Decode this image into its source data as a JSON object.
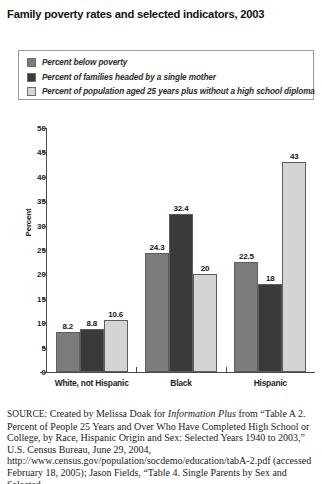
{
  "title": "Family poverty rates and selected indicators, 2003",
  "legend": {
    "items": [
      {
        "label": "Percent below poverty",
        "color": "#7c7c7c",
        "swatch_name": "legend-swatch-below-poverty"
      },
      {
        "label": "Percent of families headed by a single mother",
        "color": "#3a3a3a",
        "swatch_name": "legend-swatch-single-mother"
      },
      {
        "label": "Percent of population aged 25 years plus without a high school diploma",
        "color": "#d4d4d4",
        "swatch_name": "legend-swatch-no-diploma"
      }
    ]
  },
  "axes": {
    "ylabel": "Percent",
    "yticks": [
      "0",
      "5",
      "10",
      "15",
      "20",
      "25",
      "30",
      "35",
      "40",
      "45",
      "50"
    ]
  },
  "source": {
    "prefix": "SOURCE:",
    "line1_a": " Created by Melissa Doak for ",
    "line1_italic": "Information Plus",
    "line1_b": " from “Table A 2. Percent of People 25 Years and Over Who Have Completed High School or College, by Race, Hispanic Origin and Sex: Selected Years 1940 to 2003,” U.S. Census Bureau, June 29, 2004, http://www.census.gov/population/socdemo/education/tabA-2.pdf (accessed February 18, 2005); Jason Fields, “Table 4. Single Parents by Sex and Selected"
  },
  "chart_data": {
    "type": "bar",
    "title": "Family poverty rates and selected indicators, 2003",
    "xlabel": "",
    "ylabel": "Percent",
    "ylim": [
      0,
      50
    ],
    "ytick_step": 5,
    "grid": false,
    "legend_position": "top",
    "categories": [
      "White, not Hispanic",
      "Black",
      "Hispanic"
    ],
    "series": [
      {
        "name": "Percent below poverty",
        "color": "#7c7c7c",
        "values": [
          8.2,
          24.3,
          22.5
        ],
        "labels": [
          "8.2",
          "24.3",
          "22.5"
        ]
      },
      {
        "name": "Percent of families headed by a single mother",
        "color": "#3a3a3a",
        "values": [
          8.8,
          32.4,
          18
        ],
        "labels": [
          "8.8",
          "32.4",
          "18"
        ]
      },
      {
        "name": "Percent of population aged 25 years plus without a high school diploma",
        "color": "#d4d4d4",
        "values": [
          10.6,
          20,
          43
        ],
        "labels": [
          "10.6",
          "20",
          "43"
        ]
      }
    ]
  }
}
